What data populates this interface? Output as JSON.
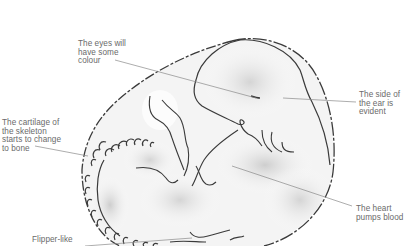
{
  "diagram": {
    "labels": [
      {
        "id": "eyes",
        "text": "The eyes will\nhave some\ncolour"
      },
      {
        "id": "ear",
        "text": "The side of\nthe  ear is\nevident"
      },
      {
        "id": "cartilage",
        "text": "The cartilage of\nthe skeleton\nstarts to change\nto bone"
      },
      {
        "id": "heart",
        "text": "The heart\npumps blood"
      },
      {
        "id": "flipper",
        "text": "Flipper-like"
      }
    ],
    "colors": {
      "outline": "#3a3a3a",
      "shading": "#d6d6d6",
      "leader": "#8a8a8a",
      "label_text": "#6a6a6a"
    }
  }
}
